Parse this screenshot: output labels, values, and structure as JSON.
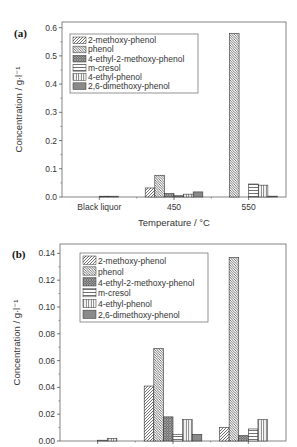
{
  "figure": {
    "series_names": [
      "2-methoxy-phenol",
      "phenol",
      "4-ethyl-2-methoxy-phenol",
      "m-cresol",
      "4-ethyl-phenol",
      "2,6-dimethoxy-phenol"
    ],
    "patterns": [
      "diag-fwd",
      "diag-back",
      "crosshatch",
      "horizontal",
      "vertical",
      "grid"
    ]
  },
  "chart_data": [
    {
      "panel": "(a)",
      "type": "bar",
      "title": "",
      "xlabel": "Temperature / °C",
      "ylabel": "Concentration / g·l⁻¹",
      "categories": [
        "Black liquor",
        "450",
        "550"
      ],
      "ylim": [
        0.0,
        0.62
      ],
      "yticks": [
        "0.0",
        "0.1",
        "0.2",
        "0.3",
        "0.4",
        "0.5",
        "0.6"
      ],
      "ytick_values": [
        0.0,
        0.1,
        0.2,
        0.3,
        0.4,
        0.5,
        0.6
      ],
      "grid": false,
      "legend_position": "upper left",
      "series": [
        {
          "name": "2-methoxy-phenol",
          "values": [
            0.0,
            0.032,
            0.0
          ]
        },
        {
          "name": "phenol",
          "values": [
            0.0,
            0.077,
            0.58
          ]
        },
        {
          "name": "4-ethyl-2-methoxy-phenol",
          "values": [
            0.0,
            0.012,
            0.0
          ]
        },
        {
          "name": "m-cresol",
          "values": [
            0.0004,
            0.006,
            0.046
          ]
        },
        {
          "name": "4-ethyl-phenol",
          "values": [
            0.002,
            0.01,
            0.042
          ]
        },
        {
          "name": "2,6-dimethoxy-phenol",
          "values": [
            0.0,
            0.018,
            0.003
          ]
        }
      ]
    },
    {
      "panel": "(b)",
      "type": "bar",
      "title": "",
      "xlabel": "",
      "ylabel": "Concentration / g·l⁻¹",
      "categories": [
        "Black liquor",
        "450",
        "550"
      ],
      "ylim": [
        0.0,
        0.147
      ],
      "yticks": [
        "0.00",
        "0.02",
        "0.04",
        "0.06",
        "0.08",
        "0.10",
        "0.12",
        "0.14"
      ],
      "ytick_values": [
        0.0,
        0.02,
        0.04,
        0.06,
        0.08,
        0.1,
        0.12,
        0.14
      ],
      "grid": false,
      "legend_position": "upper left",
      "series": [
        {
          "name": "2-methoxy-phenol",
          "values": [
            0.0,
            0.041,
            0.01
          ]
        },
        {
          "name": "phenol",
          "values": [
            0.0,
            0.069,
            0.137
          ]
        },
        {
          "name": "4-ethyl-2-methoxy-phenol",
          "values": [
            0.0,
            0.018,
            0.004
          ]
        },
        {
          "name": "m-cresol",
          "values": [
            0.0004,
            0.005,
            0.009
          ]
        },
        {
          "name": "4-ethyl-phenol",
          "values": [
            0.002,
            0.016,
            0.016
          ]
        },
        {
          "name": "2,6-dimethoxy-phenol",
          "values": [
            0.0,
            0.005,
            0.0
          ]
        }
      ]
    }
  ]
}
